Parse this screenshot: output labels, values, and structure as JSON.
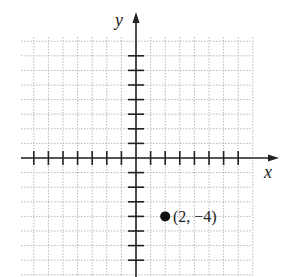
{
  "chart_data": {
    "type": "scatter",
    "title": "",
    "xlabel": "x",
    "ylabel": "y",
    "grid": true,
    "x_ticks_range": [
      -7,
      7
    ],
    "y_ticks_range": [
      -5,
      5
    ],
    "points": [
      {
        "x": 2,
        "y": -4,
        "label": "(2, −4)"
      }
    ]
  },
  "labels": {
    "x_axis": "x",
    "y_axis": "y",
    "point": "(2, −4)"
  },
  "colors": {
    "axis": "#222222",
    "grid": "#b8b8b8",
    "point": "#111111"
  }
}
